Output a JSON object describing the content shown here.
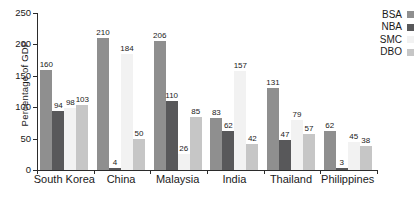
{
  "chart_data": {
    "type": "bar",
    "title": "",
    "xlabel": "",
    "ylabel": "Percentage of GDP",
    "ylim": [
      0,
      250
    ],
    "yticks": [
      0,
      50,
      100,
      150,
      200,
      250
    ],
    "grid": false,
    "legend_position": "top-right",
    "categories": [
      "South Korea",
      "China",
      "Malaysia",
      "India",
      "Thailand",
      "Philippines"
    ],
    "series": [
      {
        "name": "BSA",
        "color": "#8f8f8f",
        "values": [
          160,
          210,
          206,
          83,
          131,
          62
        ]
      },
      {
        "name": "NBA",
        "color": "#58585a",
        "values": [
          94,
          4,
          110,
          62,
          47,
          3
        ]
      },
      {
        "name": "SMC",
        "color": "#f2f2f2",
        "values": [
          98,
          184,
          26,
          157,
          79,
          45
        ]
      },
      {
        "name": "DBO",
        "color": "#c6c6c6",
        "values": [
          103,
          50,
          85,
          42,
          57,
          38
        ]
      }
    ]
  },
  "legend": {
    "items": [
      {
        "label": "BSA"
      },
      {
        "label": "NBA"
      },
      {
        "label": "SMC"
      },
      {
        "label": "DBO"
      }
    ]
  },
  "axes": {
    "y_title": "Percentage of GDP"
  }
}
